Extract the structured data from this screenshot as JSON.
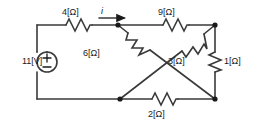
{
  "diagram": {
    "background_color": "#ffffff",
    "line_color": "#3a3a3a",
    "text_color": "#1a1a1a"
  },
  "source": {
    "label": "11[V]",
    "symbol": "voltage-source-circle",
    "plus": "+",
    "minus": "−"
  },
  "current": {
    "label": "i",
    "arrow": "right-arrow"
  },
  "resistors": [
    {
      "id": "r4",
      "label": "4[Ω]",
      "value": 4,
      "unit": "Ω",
      "placement": "top-left-horizontal"
    },
    {
      "id": "r9",
      "label": "9[Ω]",
      "value": 9,
      "unit": "Ω",
      "placement": "top-right-horizontal"
    },
    {
      "id": "r6",
      "label": "6[Ω]",
      "value": 6,
      "unit": "Ω",
      "placement": "diagonal-top-middle-to-bottom-right"
    },
    {
      "id": "r3",
      "label": "3[Ω]",
      "value": 3,
      "unit": "Ω",
      "placement": "diagonal-bottom-middle-to-top-right"
    },
    {
      "id": "r1",
      "label": "1[Ω]",
      "value": 1,
      "unit": "Ω",
      "placement": "right-vertical"
    },
    {
      "id": "r2",
      "label": "2[Ω]",
      "value": 2,
      "unit": "Ω",
      "placement": "bottom-horizontal"
    }
  ],
  "nodes": [
    {
      "id": "top-middle",
      "x": 118,
      "y": 25
    },
    {
      "id": "top-right",
      "x": 215,
      "y": 25
    },
    {
      "id": "bottom-middle",
      "x": 120,
      "y": 99
    },
    {
      "id": "bottom-right",
      "x": 215,
      "y": 99
    }
  ]
}
